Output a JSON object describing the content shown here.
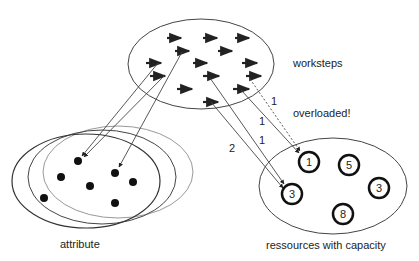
{
  "labels": {
    "worksteps": "worksteps",
    "overloaded": "overloaded!",
    "attribute": "attribute",
    "resources": "ressources with capacity"
  },
  "connections": [
    {
      "label": "1",
      "style": "dotted",
      "target": "resource-1"
    },
    {
      "label": "1",
      "style": "solid",
      "target": "resource-1"
    },
    {
      "label": "1",
      "style": "solid",
      "target": "resource-3a"
    },
    {
      "label": "2",
      "style": "solid",
      "target": "resource-3a"
    }
  ],
  "resources": [
    {
      "id": "resource-1",
      "capacity": "1"
    },
    {
      "id": "resource-5",
      "capacity": "5"
    },
    {
      "id": "resource-3a",
      "capacity": "3"
    },
    {
      "id": "resource-3b",
      "capacity": "3"
    },
    {
      "id": "resource-8",
      "capacity": "8"
    }
  ],
  "colors": {
    "stroke": "#333333",
    "faint_stroke": "#888888",
    "background": "#ffffff"
  }
}
